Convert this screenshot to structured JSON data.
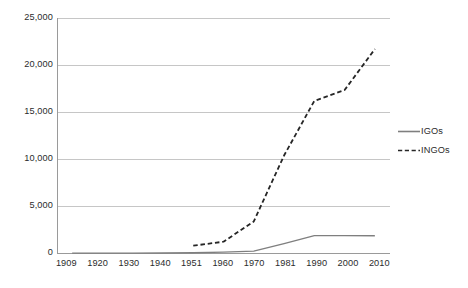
{
  "chart_data": {
    "type": "line",
    "title": "",
    "subtitle": "",
    "xlabel": "",
    "ylabel": "",
    "categories": [
      "1909",
      "1920",
      "1930",
      "1940",
      "1951",
      "1960",
      "1970",
      "1981",
      "1990",
      "2000",
      "2010"
    ],
    "ylim": [
      0,
      25000
    ],
    "y_ticks": [
      0,
      5000,
      10000,
      15000,
      20000,
      25000
    ],
    "y_tick_labels": [
      "0",
      "5,000",
      "10,000",
      "15,000",
      "20,000",
      "25,000"
    ],
    "grid": "horizontal",
    "legend_position": "right",
    "series": [
      {
        "name": "IGOs",
        "style": "solid",
        "color": "#7f7f7f",
        "values": [
          37,
          40,
          45,
          50,
          80,
          150,
          250,
          1050,
          1900,
          1900,
          1890
        ]
      },
      {
        "name": "INGOs",
        "style": "dashed",
        "color": "#262626",
        "values": [
          null,
          null,
          null,
          null,
          830,
          1250,
          3400,
          10400,
          16200,
          17350,
          21700
        ]
      }
    ],
    "annotations": []
  },
  "axes": {
    "y_labels": [
      {
        "text": "25,000",
        "value": 25000
      },
      {
        "text": "20,000",
        "value": 20000
      },
      {
        "text": "15,000",
        "value": 15000
      },
      {
        "text": "10,000",
        "value": 10000
      },
      {
        "text": "5,000",
        "value": 5000
      },
      {
        "text": "0",
        "value": 0
      }
    ],
    "x_labels": [
      "1909",
      "1920",
      "1930",
      "1940",
      "1951",
      "1960",
      "1970",
      "1981",
      "1990",
      "2000",
      "2010"
    ]
  },
  "legend": {
    "items": [
      {
        "label": "IGOs",
        "style": "solid"
      },
      {
        "label": "INGOs",
        "style": "dashed"
      }
    ]
  },
  "colors": {
    "igos_line": "#7f7f7f",
    "ingos_line": "#262626",
    "gridline": "#c6c6c6",
    "axis": "#9a9a9a",
    "text": "#2b2b2b",
    "background": "#ffffff"
  }
}
